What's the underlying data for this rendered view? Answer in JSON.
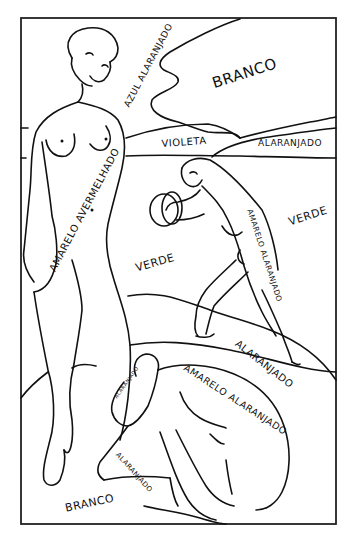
{
  "figure": {
    "type": "color-by-label line drawing",
    "line_color": "#111111",
    "background": "#ffffff",
    "frame": {
      "left": 21,
      "top": 18,
      "right": 336,
      "bottom": 524
    }
  },
  "labels": {
    "azul_alaranjado": "AZUL ALARANJADO",
    "branco_sky": "BRANCO",
    "violeta": "VIOLETA",
    "alaranjado_hill": "ALARANJADO",
    "amarelo_avermelhado": "AMARELO AVERMELHADO",
    "verde_right": "VERDE",
    "verde_center": "VERDE",
    "amarelo_alaranjado_dancer": "AMARELO ALARANJADO",
    "alaranjado_ground": "ALARANJADO",
    "amarelo_alaranjado_back": "AMARELO ALARANJADO",
    "alaranjado_legs": "ALARANJADO",
    "alaranjado_head": "ALARANJADO",
    "branco_ground": "BRANCO"
  },
  "caption": ""
}
